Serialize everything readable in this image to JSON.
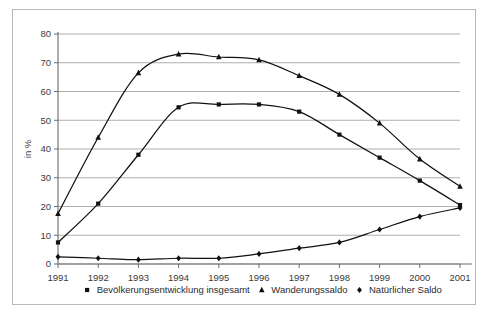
{
  "chart_data": {
    "type": "line",
    "title": "",
    "xlabel": "",
    "ylabel": "in %",
    "ylim": [
      0,
      80
    ],
    "ytick_step": 10,
    "grid": true,
    "legend_position": "bottom",
    "categories": [
      "1991",
      "1992",
      "1993",
      "1994",
      "1995",
      "1996",
      "1997",
      "1998",
      "1999",
      "2000",
      "2001"
    ],
    "series": [
      {
        "name": "Bevölkerungsentwicklung insgesamt",
        "marker": "square",
        "color": "#111111",
        "values": [
          7.5,
          21,
          38,
          54.5,
          55.5,
          55.5,
          53,
          45,
          37,
          29,
          20.5
        ]
      },
      {
        "name": "Wanderungssaldo",
        "marker": "triangle",
        "color": "#111111",
        "values": [
          17.5,
          44,
          66.5,
          73,
          72,
          71,
          65.5,
          59,
          49,
          36.5,
          27
        ]
      },
      {
        "name": "Natürlicher Saldo",
        "marker": "diamond",
        "color": "#111111",
        "values": [
          2.5,
          2,
          1.5,
          2,
          2,
          3.5,
          5.5,
          7.5,
          12,
          16.5,
          19.5
        ]
      }
    ],
    "ytick_labels": [
      "0",
      "10",
      "20",
      "30",
      "40",
      "50",
      "60",
      "70",
      "80"
    ],
    "xtick_labels": [
      "1991",
      "1992",
      "1993",
      "1994",
      "1995",
      "1996",
      "1997",
      "1998",
      "1999",
      "2000",
      "2001"
    ]
  },
  "legend": {
    "items": [
      {
        "label": "Bevölkerungsentwicklung insgesamt",
        "marker": "square"
      },
      {
        "label": "Wanderungssaldo",
        "marker": "triangle"
      },
      {
        "label": "Natürlicher Saldo",
        "marker": "diamond"
      }
    ]
  },
  "colors": {
    "frame": "#b9b9b9",
    "grid": "#9a9a9a",
    "axis": "#6b6b6b",
    "ink": "#111111",
    "text": "#3a3a3a",
    "background": "#ffffff"
  }
}
